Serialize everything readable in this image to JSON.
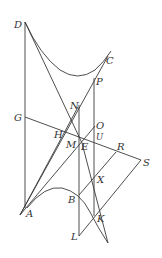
{
  "diagram": {
    "type": "geometric-construction",
    "labels": {
      "D": "D",
      "C": "C",
      "P": "P",
      "N": "N",
      "G": "G",
      "O": "O",
      "H": "H",
      "U": "U",
      "M": "M",
      "E": "E",
      "R": "R",
      "S": "S",
      "X": "X",
      "B": "B",
      "A": "A",
      "K": "K",
      "L": "L"
    },
    "colors": {
      "line": "#3a3a3a",
      "text": "#333333",
      "background": "#ffffff"
    }
  }
}
